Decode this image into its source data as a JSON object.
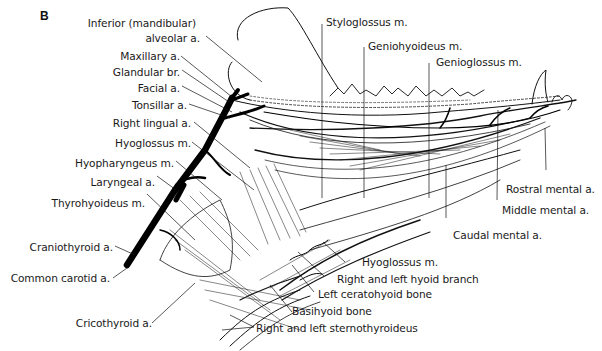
{
  "figure": {
    "panel_label": "B",
    "labels_left": [
      {
        "id": "inferior-alveolar-a",
        "text_line1": "Inferior (mandibular)",
        "text_line2": "alveolar a."
      },
      {
        "id": "maxillary-a",
        "text": "Maxillary a."
      },
      {
        "id": "glandular-br",
        "text": "Glandular br."
      },
      {
        "id": "facial-a",
        "text": "Facial a."
      },
      {
        "id": "tonsillar-a",
        "text": "Tonsillar a."
      },
      {
        "id": "right-lingual-a",
        "text": "Right lingual a."
      },
      {
        "id": "hyoglossus-m-left",
        "text": "Hyoglossus m."
      },
      {
        "id": "hyopharyngeus-m",
        "text": "Hyopharyngeus m."
      },
      {
        "id": "laryngeal-a",
        "text": "Laryngeal a."
      },
      {
        "id": "thyrohyoideus-m",
        "text": "Thyrohyoideus m."
      },
      {
        "id": "craniothyroid-a",
        "text": "Craniothyroid a."
      },
      {
        "id": "common-carotid-a",
        "text": "Common carotid a."
      },
      {
        "id": "cricothyroid-a",
        "text": "Cricothyroid a."
      }
    ],
    "labels_top": [
      {
        "id": "styloglossus-m",
        "text": "Styloglossus m."
      },
      {
        "id": "geniohyoideus-m",
        "text": "Geniohyoideus m."
      },
      {
        "id": "genioglossus-m",
        "text": "Genioglossus m."
      }
    ],
    "labels_right": [
      {
        "id": "rostral-mental-a",
        "text": "Rostral mental a."
      },
      {
        "id": "middle-mental-a",
        "text": "Middle mental a."
      },
      {
        "id": "caudal-mental-a",
        "text": "Caudal mental a."
      }
    ],
    "labels_bottom": [
      {
        "id": "hyoglossus-m-bottom",
        "text": "Hyoglossus m."
      },
      {
        "id": "hyoid-branch",
        "text": "Right and left hyoid branch"
      },
      {
        "id": "left-ceratohyoid-bone",
        "text": "Left ceratohyoid bone"
      },
      {
        "id": "basihyoid-bone",
        "text": "Basihyoid bone"
      },
      {
        "id": "sternothyroideus",
        "text": "Right and left sternothyroideus"
      }
    ]
  }
}
